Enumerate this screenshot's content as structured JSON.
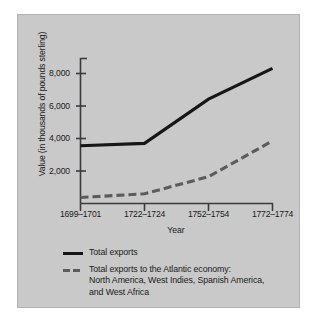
{
  "figure": {
    "background_color": "#c9c9c9",
    "border_color": "#b2b2b2",
    "page_color": "#ffffff"
  },
  "chart_data": {
    "type": "line",
    "title": "",
    "subtitle": "",
    "xlabel": "Year",
    "ylabel": "Value (in thousands of pounds sterling)",
    "categories": [
      "1699–1701",
      "1722–1724",
      "1752–1754",
      "1772–1774"
    ],
    "ylim": [
      0,
      9300
    ],
    "yticks": [
      2000,
      4000,
      6000,
      8000
    ],
    "ytick_labels": [
      "2,000",
      "4,000",
      "6,000",
      "8,000"
    ],
    "grid": false,
    "legend_position": "below-axes",
    "series": [
      {
        "name": "Total exports",
        "style": "solid",
        "color": "#161616",
        "values": [
          3550,
          3700,
          6420,
          8320
        ]
      },
      {
        "name": "Total exports to the Atlantic economy: North America, West Indies, Spanish America, and West Africa",
        "style": "dashed",
        "color": "#5c5c5c",
        "values": [
          370,
          600,
          1650,
          3850
        ]
      }
    ],
    "annotations": []
  },
  "axes": {
    "y_title": "Value (in thousands of pounds sterling)",
    "x_title": "Year",
    "y_tick_labels": [
      "8,000",
      "6,000",
      "4,000",
      "2,000"
    ],
    "x_tick_labels": [
      "1699–1701",
      "1722–1724",
      "1752–1754",
      "1772–1774"
    ]
  },
  "legend": {
    "entries": [
      {
        "style": "solid",
        "line1": "Total exports",
        "line2": "",
        "line3": ""
      },
      {
        "style": "dashed",
        "line1": "Total exports to the Atlantic economy:",
        "line2": "North America, West Indies, Spanish America,",
        "line3": "and West Africa"
      }
    ]
  }
}
